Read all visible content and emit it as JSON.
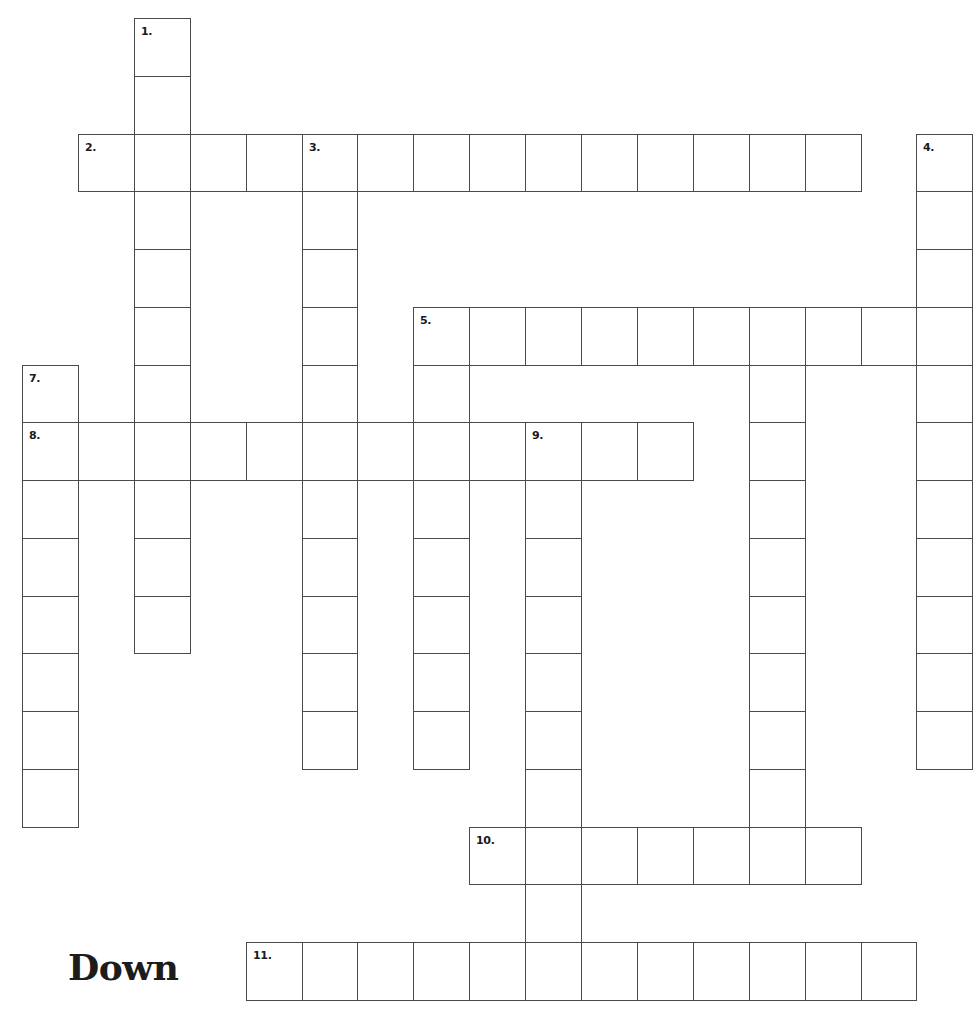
{
  "layout": {
    "origin_x": 22,
    "origin_y": 18,
    "cell_w": 55.9,
    "cell_h": 57.75
  },
  "section_heading": "Down",
  "words": [
    {
      "number": "1.",
      "direction": "down",
      "col": 2,
      "row": 0,
      "length": 11
    },
    {
      "number": "2.",
      "direction": "across",
      "col": 1,
      "row": 2,
      "length": 14
    },
    {
      "number": "3.",
      "direction": "down",
      "col": 5,
      "row": 2,
      "length": 11
    },
    {
      "number": "4.",
      "direction": "down",
      "col": 16,
      "row": 2,
      "length": 11
    },
    {
      "number": "5.",
      "direction": "across",
      "col": 7,
      "row": 5,
      "length": 10
    },
    {
      "number": "5.",
      "direction": "down",
      "col": 7,
      "row": 5,
      "length": 8
    },
    {
      "number": "",
      "direction": "down",
      "col": 13,
      "row": 5,
      "length": 10
    },
    {
      "number": "7.",
      "direction": "down",
      "col": 0,
      "row": 6,
      "length": 8
    },
    {
      "number": "8.",
      "direction": "across",
      "col": 0,
      "row": 7,
      "length": 12
    },
    {
      "number": "9.",
      "direction": "down",
      "col": 9,
      "row": 7,
      "length": 10
    },
    {
      "number": "10.",
      "direction": "across",
      "col": 8,
      "row": 14,
      "length": 7
    },
    {
      "number": "11.",
      "direction": "across",
      "col": 4,
      "row": 16,
      "length": 12
    }
  ]
}
